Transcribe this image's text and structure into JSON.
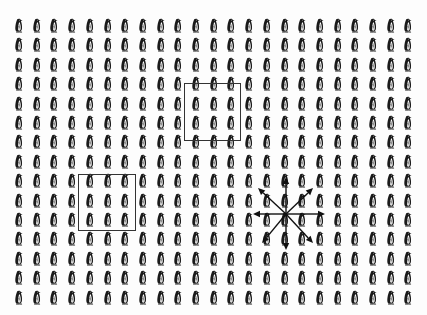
{
  "scene": {
    "description": "Grid of identical penguin icons with two rectangular selection boxes and an 8-direction arrow cluster",
    "background_color": "#ffffff",
    "ink_color": "#1a1a1a"
  },
  "grid": {
    "columns": 23,
    "rows": 15,
    "origin_x": 14,
    "origin_y": 18,
    "pitch_x": 17.7,
    "pitch_y": 19.4,
    "icon": "penguin-icon",
    "icon_facing": "right"
  },
  "rectangles": [
    {
      "name": "selection-box-upper-right",
      "x": 184,
      "y": 83,
      "width": 57,
      "height": 58,
      "stroke": "#333333"
    },
    {
      "name": "selection-box-lower-left",
      "x": 78,
      "y": 174,
      "width": 58,
      "height": 57,
      "stroke": "#333333"
    }
  ],
  "arrow_cluster": {
    "center": [
      286,
      214
    ],
    "color": "#111111",
    "arrows": [
      {
        "direction": "up",
        "tip": [
          286,
          177
        ]
      },
      {
        "direction": "down",
        "tip": [
          286,
          250
        ]
      },
      {
        "direction": "left",
        "tip": [
          253,
          214
        ]
      },
      {
        "direction": "right",
        "tip": [
          325,
          214
        ]
      },
      {
        "direction": "up-left",
        "tip": [
          258,
          188
        ]
      },
      {
        "direction": "up-right",
        "tip": [
          313,
          188
        ]
      },
      {
        "direction": "down-left",
        "tip": [
          262,
          243
        ]
      },
      {
        "direction": "down-right",
        "tip": [
          313,
          243
        ]
      }
    ]
  }
}
